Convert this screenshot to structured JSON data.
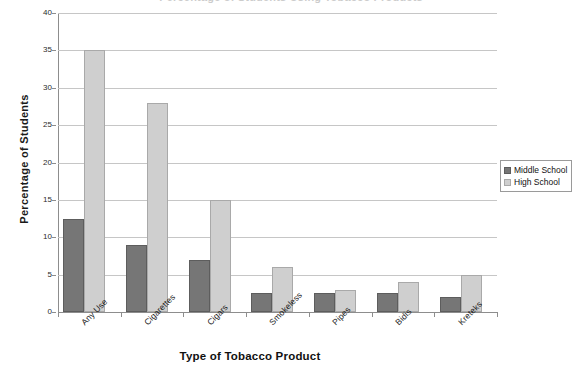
{
  "chart_data": {
    "type": "bar",
    "title": "Percentage of Students Using Tobacco Products",
    "xlabel": "Type of Tobacco Product",
    "ylabel": "Percentage of Students",
    "ylim": [
      0,
      40
    ],
    "ytick_step": 5,
    "yticks": [
      40,
      35,
      30,
      25,
      20,
      15,
      10,
      5,
      0
    ],
    "ytick_labels": [
      "40",
      "35",
      "30",
      "25",
      "20",
      "15",
      "10",
      "5",
      "0"
    ],
    "grid": true,
    "legend_position": "right",
    "categories": [
      "Any Use",
      "Cigarettes",
      "Cigars",
      "Smokeless",
      "Pipes",
      "Bidis",
      "Kreteks"
    ],
    "series": [
      {
        "name": "Middle School",
        "color": "#767676",
        "values": [
          12.5,
          9,
          7,
          2.5,
          2.5,
          2.5,
          2
        ]
      },
      {
        "name": "High School",
        "color": "#cfcfcf",
        "values": [
          35,
          28,
          15,
          6,
          3,
          4,
          5
        ]
      }
    ]
  },
  "legend": {
    "entries": [
      {
        "label": "Middle School",
        "swatch": "middle"
      },
      {
        "label": "High School",
        "swatch": "high"
      }
    ]
  },
  "colors": {
    "middle_school": "#767676",
    "high_school": "#cfcfcf",
    "gridline": "#c6c6c6",
    "axis": "#8d8d8d",
    "text": "#111111",
    "background": "#ffffff"
  }
}
